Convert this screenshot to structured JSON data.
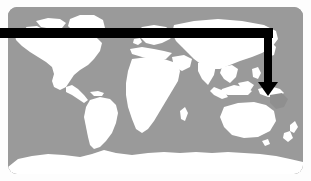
{
  "figure": {
    "kind": "world-map-with-pointer-annotation",
    "title": "",
    "caption": "",
    "background_color": "#fdfdfd"
  },
  "map": {
    "name": "world-map",
    "projection": "equirectangular",
    "ocean_color": "#9a9a9a",
    "land_color": "#ffffff",
    "highlight_color": "#8f8f8f",
    "corner_radius_px": 9,
    "bounds": {
      "x": 8,
      "y": 7,
      "width": 295,
      "height": 167
    },
    "landmasses": [
      "north-america",
      "greenland",
      "south-america",
      "europe",
      "africa",
      "asia",
      "australia",
      "new-guinea",
      "new-zealand",
      "antarctica",
      "indonesia",
      "japan",
      "british-isles",
      "madagascar"
    ]
  },
  "annotation": {
    "name": "pointer-arrow",
    "color": "#000000",
    "label": "",
    "shaft_thickness_px": 10,
    "horizontal_start_x": 0,
    "horizontal_y": 33,
    "corner_x": 268,
    "arrow_tip_x": 268,
    "arrow_tip_y": 96,
    "points_to": "new-guinea-coral-sea-region"
  },
  "chart_data": {
    "type": "map",
    "title": "",
    "xlabel": "",
    "ylabel": "",
    "regions": [
      {
        "name": "North America",
        "value": "land"
      },
      {
        "name": "South America",
        "value": "land"
      },
      {
        "name": "Europe",
        "value": "land"
      },
      {
        "name": "Africa",
        "value": "land"
      },
      {
        "name": "Asia",
        "value": "land"
      },
      {
        "name": "Australia",
        "value": "land"
      },
      {
        "name": "Antarctica",
        "value": "land"
      },
      {
        "name": "New Guinea",
        "value": "highlighted"
      }
    ],
    "annotations": [
      {
        "text": "",
        "target": "New Guinea / Coral Sea",
        "type": "arrow"
      }
    ],
    "legend": []
  }
}
